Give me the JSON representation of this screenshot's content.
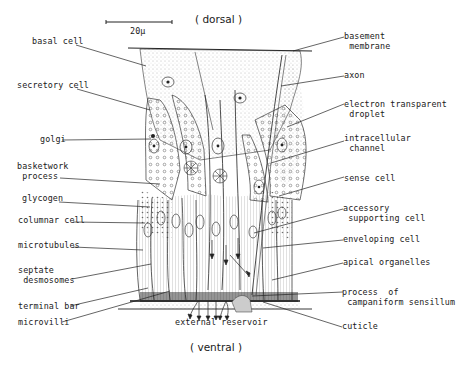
{
  "orientation": {
    "top": "( dorsal )",
    "bottom": "( ventral )"
  },
  "scale_bar": {
    "label": "20µ"
  },
  "labels_left": [
    {
      "id": "basal-cell",
      "text": "basal cell",
      "x": 32,
      "y": 41
    },
    {
      "id": "secretory-cell",
      "text": "secretory cell",
      "x": 17,
      "y": 85
    },
    {
      "id": "golgi",
      "text": "golgi",
      "x": 40,
      "y": 133
    },
    {
      "id": "basketwork-process",
      "text": "basketwork\n process",
      "x": 17,
      "y": 163
    },
    {
      "id": "glycogen",
      "text": "glycogen",
      "x": 22,
      "y": 194
    },
    {
      "id": "columnar-cell",
      "text": "columnar cell",
      "x": 18,
      "y": 214
    },
    {
      "id": "microtubules",
      "text": "microtubules",
      "x": 18,
      "y": 240
    },
    {
      "id": "septate-desmosomes",
      "text": "septate\n desmosomes",
      "x": 18,
      "y": 266
    },
    {
      "id": "terminal-bar",
      "text": "terminal bar",
      "x": 18,
      "y": 306
    },
    {
      "id": "microvilli",
      "text": "microvilli",
      "x": 18,
      "y": 322
    }
  ],
  "labels_right": [
    {
      "id": "basement-membrane",
      "text": "basement\n membrane",
      "x": 344,
      "y": 33
    },
    {
      "id": "axon",
      "text": "axon",
      "x": 344,
      "y": 71
    },
    {
      "id": "electron-transparent-droplet",
      "text": "electron transparent\n droplet",
      "x": 344,
      "y": 100
    },
    {
      "id": "intracellular-channel",
      "text": "intracellular\n channel",
      "x": 344,
      "y": 134
    },
    {
      "id": "sense-cell",
      "text": "sense cell",
      "x": 344,
      "y": 174
    },
    {
      "id": "accessory-supporting-cell",
      "text": "accessory\n supporting cell",
      "x": 343,
      "y": 204
    },
    {
      "id": "enveloping-cell",
      "text": "enveloping cell",
      "x": 343,
      "y": 235
    },
    {
      "id": "apical-organelles",
      "text": "apical organelles",
      "x": 343,
      "y": 258
    },
    {
      "id": "process-of-campaniform-sensillum",
      "text": "process  of\n campaniform sensillum",
      "x": 342,
      "y": 288
    },
    {
      "id": "cuticle",
      "text": "cuticle",
      "x": 342,
      "y": 322
    }
  ],
  "bottom_caption": {
    "text": "external reservoir"
  },
  "colors": {
    "ink": "#1a1a1a",
    "stipple": "#9a9a9a",
    "background": "#ffffff"
  }
}
